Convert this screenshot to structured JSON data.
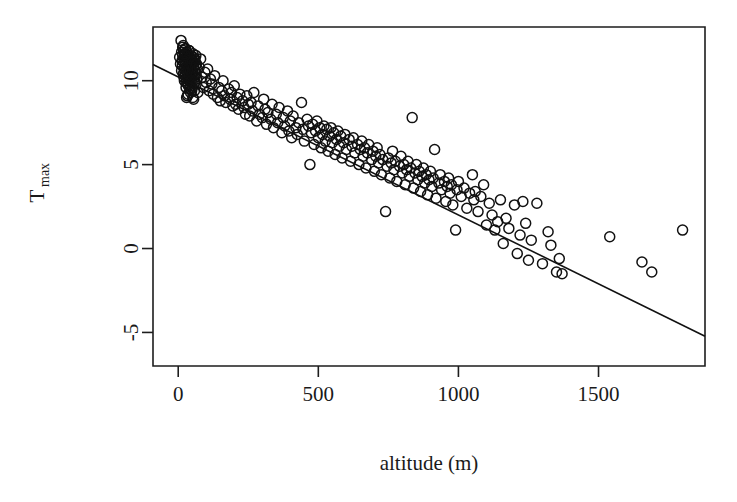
{
  "figure": {
    "background": "#ffffff",
    "foreground": "#111111",
    "width": 737,
    "height": 502
  },
  "chart_data": {
    "type": "scatter",
    "title": "",
    "subtitle": "",
    "xlabel": "altitude (m)",
    "ylabel": "Tmax",
    "ylabel_base": "T",
    "ylabel_subscript": "max",
    "xlim": [
      -90,
      1880
    ],
    "ylim": [
      -7.0,
      13.2
    ],
    "xticks": [
      0,
      500,
      1000,
      1500
    ],
    "xticklabels": [
      "0",
      "500",
      "1000",
      "1500"
    ],
    "yticks": [
      -5,
      0,
      5,
      10
    ],
    "yticklabels": [
      "-5",
      "0",
      "5",
      "10"
    ],
    "grid": false,
    "legend": null,
    "marker": "open-circle",
    "marker_radius_px": 5.0,
    "point_color": "#111111",
    "point_fill": "none",
    "n_points": 297,
    "fit": {
      "type": "linear-regression",
      "equation": "Tmax = 10.22 - 0.00822 * altitude",
      "intercept": 10.22,
      "slope": -0.00822,
      "x_start": -90,
      "x_end": 1880,
      "y_start": 10.96,
      "y_end": -5.23,
      "color": "#111111"
    },
    "x": [
      5,
      8,
      10,
      12,
      14,
      15,
      16,
      18,
      19,
      20,
      20,
      21,
      22,
      22,
      23,
      24,
      25,
      25,
      26,
      27,
      28,
      28,
      29,
      30,
      30,
      31,
      32,
      32,
      33,
      34,
      35,
      35,
      36,
      37,
      38,
      38,
      39,
      40,
      40,
      41,
      42,
      43,
      44,
      45,
      45,
      46,
      47,
      48,
      49,
      50,
      50,
      51,
      52,
      53,
      54,
      55,
      55,
      56,
      57,
      58,
      59,
      60,
      60,
      62,
      63,
      64,
      65,
      66,
      68,
      70,
      30,
      42,
      55,
      18,
      26,
      35,
      48,
      22,
      33,
      44,
      12,
      28,
      39,
      52,
      16,
      24,
      36,
      47,
      58,
      64,
      75,
      80,
      85,
      90,
      95,
      100,
      105,
      110,
      115,
      120,
      125,
      130,
      140,
      145,
      150,
      155,
      160,
      165,
      170,
      180,
      185,
      190,
      195,
      200,
      205,
      210,
      215,
      220,
      230,
      235,
      240,
      245,
      250,
      255,
      260,
      265,
      270,
      280,
      285,
      290,
      300,
      305,
      310,
      315,
      320,
      330,
      335,
      340,
      350,
      355,
      360,
      370,
      375,
      380,
      390,
      395,
      400,
      405,
      410,
      420,
      425,
      430,
      440,
      445,
      450,
      460,
      465,
      470,
      475,
      480,
      485,
      490,
      495,
      500,
      505,
      510,
      515,
      520,
      525,
      530,
      535,
      540,
      545,
      550,
      555,
      560,
      565,
      570,
      575,
      580,
      585,
      590,
      595,
      600,
      610,
      615,
      620,
      625,
      630,
      640,
      645,
      650,
      655,
      660,
      665,
      670,
      675,
      680,
      690,
      695,
      700,
      705,
      710,
      715,
      720,
      725,
      730,
      740,
      745,
      750,
      755,
      760,
      765,
      770,
      775,
      780,
      790,
      795,
      800,
      805,
      810,
      815,
      820,
      825,
      830,
      835,
      840,
      845,
      850,
      855,
      860,
      865,
      870,
      875,
      880,
      885,
      890,
      895,
      900,
      905,
      910,
      915,
      920,
      930,
      935,
      940,
      950,
      955,
      960,
      965,
      970,
      975,
      980,
      990,
      995,
      1000,
      1010,
      1020,
      1030,
      1040,
      1050,
      1055,
      1060,
      1070,
      1080,
      1090,
      1100,
      1110,
      1120,
      1130,
      1140,
      1150,
      1160,
      1170,
      1180,
      1200,
      1210,
      1220,
      1230,
      1240,
      1250,
      1260,
      1280,
      1300,
      1320,
      1330,
      1350,
      1360,
      1370,
      1540,
      1655,
      1690,
      1800
    ],
    "y": [
      11.4,
      11.0,
      12.4,
      10.6,
      11.2,
      10.9,
      11.5,
      10.4,
      11.8,
      10.2,
      11.1,
      10.7,
      11.3,
      10.0,
      11.6,
      10.5,
      11.9,
      10.3,
      11.0,
      10.8,
      11.4,
      9.9,
      10.6,
      11.2,
      10.1,
      11.7,
      10.4,
      11.5,
      10.9,
      10.2,
      11.3,
      9.8,
      10.7,
      11.1,
      10.5,
      11.8,
      10.0,
      11.4,
      10.3,
      10.8,
      11.2,
      9.7,
      10.6,
      11.5,
      10.1,
      10.9,
      11.3,
      10.4,
      11.0,
      10.7,
      9.6,
      11.2,
      10.5,
      11.6,
      10.0,
      10.8,
      11.4,
      10.3,
      11.1,
      9.9,
      10.6,
      11.3,
      10.2,
      10.9,
      11.5,
      10.4,
      11.0,
      10.1,
      10.7,
      9.3,
      9.0,
      9.5,
      8.9,
      12.1,
      11.9,
      9.2,
      9.4,
      11.6,
      9.1,
      9.3,
      11.7,
      9.6,
      11.8,
      9.0,
      12.0,
      11.5,
      9.7,
      10.0,
      9.4,
      9.8,
      10.8,
      11.3,
      10.2,
      9.6,
      10.5,
      9.9,
      10.7,
      9.4,
      10.1,
      9.8,
      9.2,
      10.3,
      9.0,
      9.6,
      8.8,
      9.4,
      10.0,
      9.1,
      8.7,
      9.5,
      8.9,
      9.3,
      8.5,
      9.7,
      8.6,
      9.0,
      8.3,
      9.2,
      8.8,
      8.4,
      8.0,
      9.1,
      8.6,
      7.9,
      8.7,
      8.2,
      9.3,
      7.6,
      8.5,
      8.0,
      7.8,
      8.9,
      8.3,
      7.4,
      8.1,
      7.7,
      8.6,
      7.2,
      8.0,
      7.5,
      8.4,
      6.9,
      7.8,
      7.3,
      8.2,
      7.0,
      7.6,
      6.6,
      7.9,
      7.2,
      6.8,
      7.5,
      8.7,
      7.1,
      6.4,
      7.7,
      7.3,
      5.0,
      6.9,
      7.4,
      6.2,
      7.0,
      7.6,
      6.6,
      7.2,
      6.0,
      6.8,
      7.3,
      6.4,
      7.1,
      5.8,
      6.7,
      7.2,
      6.3,
      6.9,
      5.6,
      6.5,
      7.0,
      6.1,
      6.7,
      5.4,
      6.3,
      6.8,
      5.9,
      6.5,
      5.2,
      6.1,
      6.6,
      5.7,
      6.2,
      5.0,
      5.9,
      6.4,
      5.5,
      6.0,
      4.8,
      5.7,
      6.2,
      5.3,
      5.8,
      4.6,
      5.5,
      6.0,
      5.1,
      5.6,
      4.4,
      5.3,
      2.2,
      4.9,
      5.4,
      4.2,
      5.1,
      5.8,
      4.7,
      5.2,
      4.0,
      4.9,
      5.5,
      4.5,
      5.0,
      3.8,
      4.7,
      5.2,
      4.3,
      4.8,
      7.8,
      3.6,
      4.5,
      5.0,
      4.1,
      4.6,
      3.4,
      4.3,
      4.8,
      3.9,
      4.4,
      3.2,
      4.1,
      4.6,
      3.7,
      4.2,
      5.9,
      3.0,
      3.9,
      4.4,
      3.5,
      4.0,
      2.8,
      3.7,
      4.2,
      3.3,
      3.8,
      2.6,
      1.1,
      3.5,
      4.0,
      3.1,
      3.6,
      2.4,
      3.3,
      4.4,
      2.9,
      3.4,
      2.2,
      3.1,
      3.8,
      1.4,
      2.7,
      2.0,
      1.1,
      1.6,
      2.9,
      0.3,
      1.8,
      1.2,
      2.6,
      -0.3,
      0.8,
      2.8,
      1.5,
      -0.7,
      0.5,
      2.7,
      -0.9,
      1.0,
      0.2,
      -1.4,
      -0.6,
      -1.5,
      0.7,
      -0.8,
      -1.4,
      1.1,
      -0.3,
      -1.2,
      -0.4,
      -1.3,
      -1.5,
      -5.3,
      -5.5,
      -6.0
    ]
  }
}
